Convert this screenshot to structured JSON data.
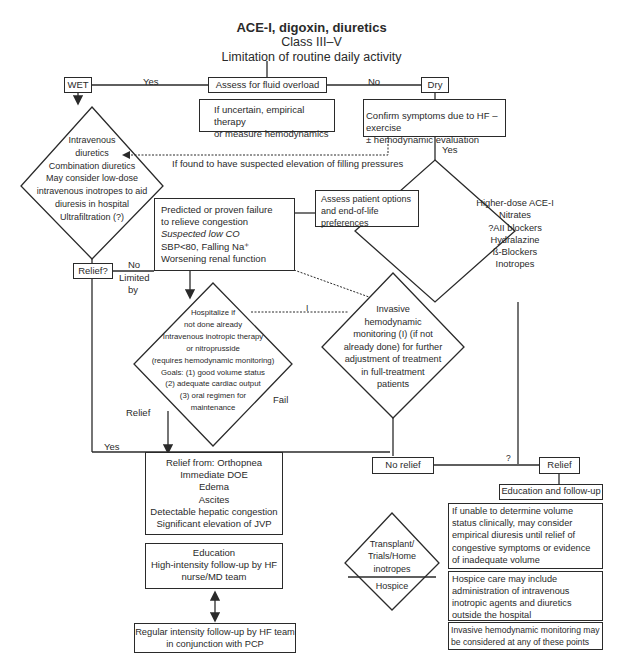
{
  "header": {
    "title": "ACE-I, digoxin, diuretics",
    "subtitle_1": "Class III–V",
    "subtitle_2": "Limitation of routine daily activity"
  },
  "nodes": {
    "assess_fluid": "Assess for fluid overload",
    "uncertain": [
      "If uncertain, empirical therapy",
      "or  measure hemodynamics"
    ],
    "wet": "WET",
    "dry": "Dry",
    "confirm_hf": [
      "Confirm symptoms due to HF – exercise",
      "± hemodynamic evaluation"
    ],
    "iv_diuretics": [
      "Intravenous",
      "diuretics",
      "Combination diuretics",
      "May consider low-dose",
      "intravenous inotropes to aid",
      "diuresis in hospital",
      "Ultrafiltration (?)"
    ],
    "relief_q": "Relief?",
    "predicted_failure": {
      "line1": "Predicted or proven failure",
      "line2": "to relieve congestion",
      "line3": "Suspected low CO",
      "line4": "SBP<80,     Falling Na⁺",
      "line5": "Worsening renal function"
    },
    "assess_options": [
      "Assess patient options",
      "and end-of-life",
      "preferences"
    ],
    "higher_dose": [
      "Higher-dose ACE-I",
      "Nitrates",
      "?AII blockers",
      "Hydralazine",
      "ß-Blockers",
      "Inotropes"
    ],
    "hospitalize": [
      "Hospitalize if",
      "not done already",
      "Intravenous inotropic therapy",
      "or nitroprusside",
      "(requires hemodynamic monitoring)",
      "Goals: (1) good volume status",
      "(2) adequate cardiac output",
      "(3) oral regimen for",
      "maintenance"
    ],
    "invasive": [
      "Invasive",
      "hemodynamic",
      "monitoring (I) (if not",
      "already done) for further",
      "adjustment of treatment",
      "in full-treatment",
      "patients"
    ],
    "relief_from": [
      "Relief from: Orthopnea",
      "Immediate DOE",
      "Edema",
      "Ascites",
      "Detectable hepatic congestion",
      "Significant elevation of JVP"
    ],
    "no_relief": "No relief",
    "relief": "Relief",
    "education_followup": "Education and follow-up",
    "unable_determine": [
      "If unable to determine volume",
      "status clinically, may consider",
      "empirical diuresis until relief of",
      "congestive symptoms or evidence",
      "of inadequate volume"
    ],
    "hospice_care": [
      "Hospice care may include",
      "administration of intravenous",
      "inotropic agents and diuretics",
      "outside the hospital"
    ],
    "invasive_note": [
      "Invasive hemodynamic monitoring may",
      "be considered at any of these points"
    ],
    "education_high": [
      "Education",
      "High-intensity follow-up by HF",
      "nurse/MD team"
    ],
    "regular_followup": [
      "Regular intensity follow-up by HF team",
      "in conjunction with PCP"
    ],
    "transplant": [
      "Transplant/",
      "Trials/Home",
      "inotropes"
    ],
    "hospice": "Hospice"
  },
  "edge_labels": {
    "yes_wet": "Yes",
    "no_dry": "No",
    "filling_pressures": "If found to have suspected elevation of filling pressures",
    "yes_confirm": "Yes",
    "no_relief_q": "No",
    "limited": "Limited",
    "by": "by",
    "i_label": "I",
    "relief_label": "Relief",
    "fail_label": "Fail",
    "yes_bottom": "Yes",
    "question_mark": "?"
  }
}
